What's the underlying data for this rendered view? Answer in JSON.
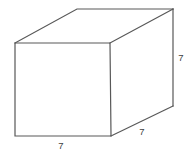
{
  "figure": {
    "name": "rectangular-prism-cube",
    "type": "3d-solid-diagram",
    "projection": "oblique-cabinet",
    "background_color": "#ffffff",
    "edge_color": "#585858",
    "edge_width": 1.2,
    "face_color": "#ffffff",
    "label_color": "#3f3f3f",
    "labels": {
      "bottom_front_edge": "7",
      "right_vertical_edge": "7",
      "bottom_right_depth_edge": "7"
    },
    "vertices": {
      "front_top_left": [
        15,
        43
      ],
      "front_top_right": [
        110,
        43
      ],
      "front_bottom_right": [
        111,
        136
      ],
      "front_bottom_left": [
        15,
        136
      ],
      "back_top_left": [
        77,
        9
      ],
      "back_top_right": [
        173,
        9
      ],
      "back_bottom_right": [
        173,
        106
      ]
    },
    "label_positions": {
      "bottom_front_edge": [
        61,
        149
      ],
      "right_vertical_edge": [
        181,
        61
      ],
      "bottom_right_depth_edge": [
        142,
        135
      ]
    }
  }
}
